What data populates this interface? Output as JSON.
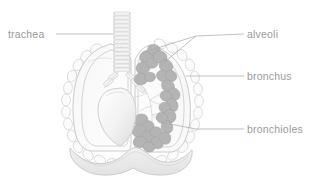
{
  "figure": {
    "style": "grayscale faded anatomical illustration",
    "background_color": "#ffffff",
    "label_color": "#9a9a9a",
    "leader_line_color": "#a8a8a8",
    "alveoli_fill_color": "#b4b4b4",
    "outline_color": "#c4c4c4"
  },
  "labels": [
    {
      "id": "trachea",
      "text": "trachea",
      "side": "left",
      "text_x": 8,
      "text_y": 38,
      "leader": "M 56 34 L 113 34"
    },
    {
      "id": "alveoli",
      "text": "alveoli",
      "side": "right",
      "text_x": 247,
      "text_y": 38,
      "leader": "M 244 34 L 196 36 M 196 36 L 151 50 M 196 36 L 161 65"
    },
    {
      "id": "bronchus",
      "text": "bronchus",
      "side": "right",
      "text_x": 247,
      "text_y": 80,
      "leader": "M 244 76 L 186 76"
    },
    {
      "id": "bronchioles",
      "text": "bronchioles",
      "side": "right",
      "text_x": 247,
      "text_y": 133,
      "leader": "M 244 129 L 196 129 L 160 122"
    }
  ],
  "anatomy_parts": [
    {
      "id": "trachea",
      "name": "trachea",
      "description": "segmented cartilage tube at top center"
    },
    {
      "id": "bronchus",
      "name": "bronchus",
      "description": "branching airway entering each lung"
    },
    {
      "id": "left-lung",
      "name": "left lung",
      "description": "hollow outlined lung on viewer left"
    },
    {
      "id": "right-lung",
      "name": "right lung",
      "description": "cutaway lung showing alveoli clusters on viewer right"
    },
    {
      "id": "alveoli",
      "name": "alveoli",
      "description": "dark gray grape-like clusters"
    },
    {
      "id": "bronchioles",
      "name": "bronchioles",
      "description": "fine branching airway tree"
    },
    {
      "id": "ribs",
      "name": "ribs",
      "description": "scalloped oval ring outline around lungs"
    },
    {
      "id": "heart",
      "name": "heart",
      "description": "pale rounded organ at center"
    },
    {
      "id": "diaphragm",
      "name": "diaphragm",
      "description": "wavy band beneath the lungs"
    }
  ]
}
